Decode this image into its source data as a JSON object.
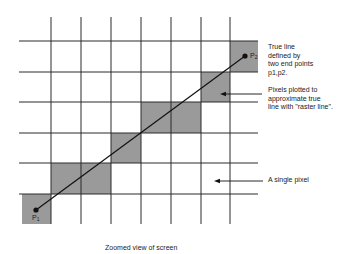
{
  "diagram": {
    "title": "Zoomed view of screen",
    "grid": {
      "vertical_lines_x": [
        51,
        81,
        111,
        141,
        171,
        201,
        230
      ],
      "horizontal_lines_y": [
        41,
        72,
        102,
        133,
        163,
        194
      ],
      "line_color": "#2a2a2a",
      "pixel_fill": "#9a9a9a"
    },
    "shaded_pixels": [
      {
        "x": 230,
        "y": 41,
        "w": 28,
        "h": 31
      },
      {
        "x": 201,
        "y": 72,
        "w": 29,
        "h": 30
      },
      {
        "x": 141,
        "y": 102,
        "w": 60,
        "h": 31
      },
      {
        "x": 111,
        "y": 133,
        "w": 30,
        "h": 30
      },
      {
        "x": 51,
        "y": 163,
        "w": 60,
        "h": 31
      },
      {
        "x": 22,
        "y": 194,
        "w": 29,
        "h": 30
      }
    ],
    "points": {
      "p1": {
        "label": "P1",
        "x": 36,
        "y": 210
      },
      "p2": {
        "label": "P2",
        "x": 245,
        "y": 56
      }
    },
    "annotations": {
      "true_line": [
        "True line",
        "defined by",
        "two end points",
        "p1,p2."
      ],
      "raster": [
        "Pixels plotted to",
        "approximate true",
        "line with \"raster line\"."
      ],
      "single_pixel": "A single pixel"
    }
  }
}
